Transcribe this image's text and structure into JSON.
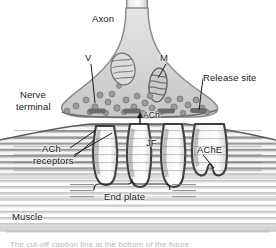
{
  "figure": {
    "labels": {
      "axon": "Axon",
      "vesicle": "V",
      "mitochondrion": "M",
      "release_site": "Release site",
      "nerve_line1": "Nerve",
      "nerve_line2": "terminal",
      "ach_transmitter": "ACh",
      "ach_receptors_line1": "ACh",
      "ach_receptors_line2": "receptors",
      "junctional_fold": "JF",
      "acetylcholinesterase": "AChE",
      "end_plate": "End plate",
      "muscle": "Muscle",
      "caption_clipped": "The cut-off caption line at the bottom of the figure"
    },
    "colors": {
      "ink": "#1a1a1a",
      "terminal_fill": "#d7d7d7",
      "terminal_outline": "#8d8d8d",
      "axon_fill": "#e6e6e6",
      "vesicle_fill": "#9a9a9a",
      "release_bar": "#6a6a6a",
      "muscle_band": "#c9c9c9",
      "fold_fill": "#fbfbfb",
      "fold_outline": "#4a4a4a",
      "background": "#ffffff"
    },
    "structures": [
      {
        "name": "axon",
        "kind": "tube"
      },
      {
        "name": "nerve-terminal",
        "kind": "bouton"
      },
      {
        "name": "synaptic-vesicles",
        "kind": "dots",
        "count": 28
      },
      {
        "name": "mitochondria",
        "kind": "ovals",
        "count": 2
      },
      {
        "name": "release-sites",
        "kind": "bars",
        "count": 4
      },
      {
        "name": "junctional-folds",
        "kind": "folds",
        "count": 4
      },
      {
        "name": "muscle-striations",
        "kind": "horizontal-lines"
      },
      {
        "name": "end-plate-brace",
        "kind": "brace"
      }
    ]
  }
}
